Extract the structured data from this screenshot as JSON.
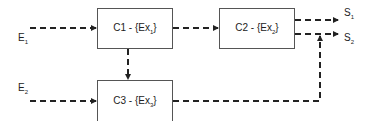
{
  "inputs": [
    {
      "id": "E1",
      "main": "E",
      "sub": "1"
    },
    {
      "id": "E2",
      "main": "E",
      "sub": "2"
    }
  ],
  "outputs": [
    {
      "id": "S1",
      "main": "S",
      "sub": "1"
    },
    {
      "id": "S2",
      "main": "S",
      "sub": "2"
    }
  ],
  "blocks": [
    {
      "id": "C1",
      "prefix": "C1 - {Ex",
      "sub": "1",
      "suffix": "}"
    },
    {
      "id": "C2",
      "prefix": "C2 - {Ex",
      "sub": "2",
      "suffix": "}"
    },
    {
      "id": "C3",
      "prefix": "C3 - {Ex",
      "sub": "3",
      "suffix": "}"
    }
  ],
  "colors": {
    "line": "#222222",
    "box_border": "#555555"
  }
}
